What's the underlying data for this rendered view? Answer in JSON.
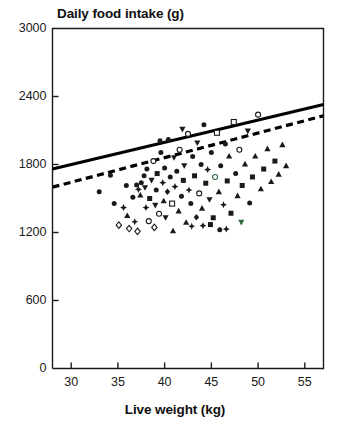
{
  "chart_data": {
    "type": "scatter",
    "title": "Daily food intake (g)",
    "xlabel": "Live weight (kg)",
    "ylabel": "Daily food intake (g)",
    "xlim": [
      28,
      57
    ],
    "ylim": [
      0,
      3000
    ],
    "xticks": [
      30,
      35,
      40,
      45,
      50,
      55
    ],
    "yticks": [
      0,
      600,
      1200,
      1800,
      2400,
      3000
    ],
    "grid": false,
    "legend": "none",
    "colors": {
      "axis": "#1a1a1a",
      "marker": "#1a1a1a",
      "solid_line": "#000000",
      "dashed_line": "#000000",
      "accent_green": "#2f6b3f"
    },
    "lines": [
      {
        "name": "upper-solid-line",
        "style": "solid",
        "x": [
          28,
          57
        ],
        "y": [
          1760,
          2330
        ]
      },
      {
        "name": "lower-dashed-line",
        "style": "dashed",
        "x": [
          28,
          57
        ],
        "y": [
          1600,
          2230
        ]
      }
    ],
    "series": [
      {
        "name": "observations",
        "marker": "mixed",
        "points": [
          {
            "x": 33.0,
            "y": 1560,
            "m": "circle-filled"
          },
          {
            "x": 34.6,
            "y": 1455,
            "m": "circle-filled"
          },
          {
            "x": 35.1,
            "y": 1265,
            "m": "diamond-open"
          },
          {
            "x": 35.6,
            "y": 1420,
            "m": "star"
          },
          {
            "x": 36.0,
            "y": 1350,
            "m": "triangle-up-filled"
          },
          {
            "x": 36.2,
            "y": 1235,
            "m": "diamond-open"
          },
          {
            "x": 36.6,
            "y": 1510,
            "m": "circle-filled"
          },
          {
            "x": 37.0,
            "y": 1620,
            "m": "circle-filled"
          },
          {
            "x": 37.2,
            "y": 1580,
            "m": "star"
          },
          {
            "x": 37.4,
            "y": 1530,
            "m": "triangle-up-filled"
          },
          {
            "x": 37.5,
            "y": 1640,
            "m": "circle-filled"
          },
          {
            "x": 37.8,
            "y": 1700,
            "m": "circle-filled"
          },
          {
            "x": 37.9,
            "y": 1595,
            "m": "triangle-down-filled"
          },
          {
            "x": 38.0,
            "y": 1420,
            "m": "star"
          },
          {
            "x": 38.1,
            "y": 1760,
            "m": "circle-filled"
          },
          {
            "x": 38.3,
            "y": 1300,
            "m": "circle-open"
          },
          {
            "x": 38.4,
            "y": 1500,
            "m": "square-filled"
          },
          {
            "x": 38.6,
            "y": 1660,
            "m": "triangle-down-filled"
          },
          {
            "x": 38.8,
            "y": 1830,
            "m": "circle-open"
          },
          {
            "x": 39.0,
            "y": 1440,
            "m": "triangle-down-filled"
          },
          {
            "x": 39.1,
            "y": 1575,
            "m": "circle-filled"
          },
          {
            "x": 39.2,
            "y": 1720,
            "m": "square-filled"
          },
          {
            "x": 39.4,
            "y": 1365,
            "m": "circle-open"
          },
          {
            "x": 39.6,
            "y": 1905,
            "m": "circle-filled"
          },
          {
            "x": 39.8,
            "y": 1640,
            "m": "star"
          },
          {
            "x": 39.9,
            "y": 1480,
            "m": "triangle-up-filled"
          },
          {
            "x": 40.0,
            "y": 1770,
            "m": "circle-filled"
          },
          {
            "x": 40.1,
            "y": 1330,
            "m": "triangle-down-filled"
          },
          {
            "x": 40.3,
            "y": 1560,
            "m": "diamond-filled"
          },
          {
            "x": 40.4,
            "y": 2020,
            "m": "circle-filled"
          },
          {
            "x": 40.6,
            "y": 1690,
            "m": "circle-filled"
          },
          {
            "x": 40.8,
            "y": 1455,
            "m": "square-open"
          },
          {
            "x": 41.0,
            "y": 1860,
            "m": "triangle-down-filled"
          },
          {
            "x": 41.1,
            "y": 1605,
            "m": "star"
          },
          {
            "x": 41.3,
            "y": 1740,
            "m": "circle-filled"
          },
          {
            "x": 41.5,
            "y": 1390,
            "m": "triangle-up-filled"
          },
          {
            "x": 41.6,
            "y": 1930,
            "m": "circle-open"
          },
          {
            "x": 41.8,
            "y": 1520,
            "m": "circle-filled"
          },
          {
            "x": 42.0,
            "y": 1660,
            "m": "square-filled"
          },
          {
            "x": 42.1,
            "y": 1790,
            "m": "triangle-down-filled"
          },
          {
            "x": 42.3,
            "y": 1290,
            "m": "triangle-up-filled"
          },
          {
            "x": 42.5,
            "y": 2070,
            "m": "circle-open"
          },
          {
            "x": 42.6,
            "y": 1575,
            "m": "star"
          },
          {
            "x": 42.8,
            "y": 1455,
            "m": "circle-filled"
          },
          {
            "x": 43.0,
            "y": 1870,
            "m": "circle-filled"
          },
          {
            "x": 43.2,
            "y": 1700,
            "m": "square-filled"
          },
          {
            "x": 43.4,
            "y": 1335,
            "m": "diamond-filled"
          },
          {
            "x": 43.5,
            "y": 1990,
            "m": "triangle-down-filled"
          },
          {
            "x": 43.7,
            "y": 1545,
            "m": "circle-open"
          },
          {
            "x": 43.9,
            "y": 1800,
            "m": "circle-filled"
          },
          {
            "x": 44.0,
            "y": 1415,
            "m": "triangle-up-filled"
          },
          {
            "x": 44.2,
            "y": 2150,
            "m": "circle-filled"
          },
          {
            "x": 44.4,
            "y": 1635,
            "m": "square-filled"
          },
          {
            "x": 44.6,
            "y": 1755,
            "m": "star"
          },
          {
            "x": 44.8,
            "y": 1490,
            "m": "triangle-down-filled"
          },
          {
            "x": 45.0,
            "y": 1905,
            "m": "circle-filled"
          },
          {
            "x": 45.2,
            "y": 1330,
            "m": "square-filled"
          },
          {
            "x": 45.4,
            "y": 1690,
            "m": "circle-open"
          },
          {
            "x": 45.6,
            "y": 2080,
            "m": "square-open"
          },
          {
            "x": 45.8,
            "y": 1560,
            "m": "triangle-up-filled"
          },
          {
            "x": 46.0,
            "y": 1790,
            "m": "circle-filled"
          },
          {
            "x": 46.3,
            "y": 1445,
            "m": "star"
          },
          {
            "x": 46.5,
            "y": 1980,
            "m": "circle-filled"
          },
          {
            "x": 46.7,
            "y": 1655,
            "m": "square-filled"
          },
          {
            "x": 46.9,
            "y": 1875,
            "m": "triangle-up-filled"
          },
          {
            "x": 47.1,
            "y": 1370,
            "m": "square-filled"
          },
          {
            "x": 47.4,
            "y": 2175,
            "m": "square-open"
          },
          {
            "x": 47.6,
            "y": 1720,
            "m": "circle-filled"
          },
          {
            "x": 47.8,
            "y": 1525,
            "m": "triangle-up-filled"
          },
          {
            "x": 48.0,
            "y": 1930,
            "m": "circle-open"
          },
          {
            "x": 48.3,
            "y": 1615,
            "m": "square-filled"
          },
          {
            "x": 48.6,
            "y": 1805,
            "m": "triangle-up-filled"
          },
          {
            "x": 48.9,
            "y": 2095,
            "m": "triangle-down-filled"
          },
          {
            "x": 49.1,
            "y": 1460,
            "m": "circle-filled"
          },
          {
            "x": 49.4,
            "y": 1690,
            "m": "square-filled"
          },
          {
            "x": 49.7,
            "y": 1875,
            "m": "triangle-up-filled"
          },
          {
            "x": 50.0,
            "y": 2240,
            "m": "circle-open"
          },
          {
            "x": 50.3,
            "y": 1585,
            "m": "triangle-up-filled"
          },
          {
            "x": 50.6,
            "y": 1760,
            "m": "square-filled"
          },
          {
            "x": 51.0,
            "y": 1940,
            "m": "triangle-up-filled"
          },
          {
            "x": 51.4,
            "y": 1650,
            "m": "triangle-up-filled"
          },
          {
            "x": 51.8,
            "y": 1830,
            "m": "square-filled"
          },
          {
            "x": 52.2,
            "y": 1715,
            "m": "triangle-up-filled"
          },
          {
            "x": 52.6,
            "y": 1975,
            "m": "triangle-up-filled"
          },
          {
            "x": 53.0,
            "y": 1790,
            "m": "triangle-up-filled"
          },
          {
            "x": 35.9,
            "y": 1615,
            "m": "circle-filled"
          },
          {
            "x": 36.8,
            "y": 1295,
            "m": "star"
          },
          {
            "x": 38.9,
            "y": 1245,
            "m": "diamond-open"
          },
          {
            "x": 40.9,
            "y": 1215,
            "m": "triangle-up-filled"
          },
          {
            "x": 42.9,
            "y": 1255,
            "m": "star"
          },
          {
            "x": 44.9,
            "y": 1270,
            "m": "square-filled"
          },
          {
            "x": 46.6,
            "y": 1230,
            "m": "star"
          },
          {
            "x": 48.2,
            "y": 1290,
            "m": "triangle-down-filled"
          },
          {
            "x": 34.2,
            "y": 1705,
            "m": "circle-filled"
          },
          {
            "x": 39.5,
            "y": 2010,
            "m": "circle-filled"
          },
          {
            "x": 41.9,
            "y": 2110,
            "m": "triangle-down-filled"
          },
          {
            "x": 44.1,
            "y": 1260,
            "m": "star"
          },
          {
            "x": 45.9,
            "y": 1225,
            "m": "circle-filled"
          },
          {
            "x": 37.1,
            "y": 1210,
            "m": "diamond-open"
          }
        ]
      }
    ]
  }
}
